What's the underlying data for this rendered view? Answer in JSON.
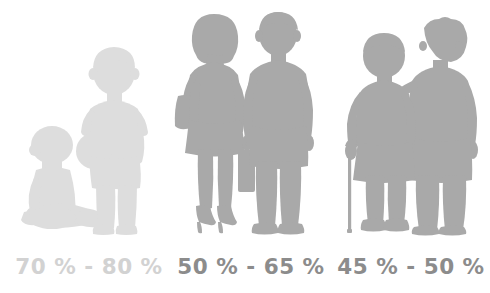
{
  "infographic": {
    "title": "Body water percentage by life stage",
    "background_color": "#ffffff",
    "groups": [
      {
        "id": "children",
        "name": "infants-and-children",
        "label": "70 % - 80 %",
        "range_low": 70,
        "range_high": 80,
        "unit": "%",
        "color": "#dddddd",
        "figures": [
          {
            "name": "sitting-baby",
            "pose": "seated profile facing right"
          },
          {
            "name": "standing-boy-with-ball",
            "pose": "standing, holding ball at left hip"
          }
        ],
        "props": [
          "ball"
        ]
      },
      {
        "id": "adults",
        "name": "adults",
        "label": "50 % - 65 %",
        "range_low": 50,
        "range_high": 65,
        "unit": "%",
        "color": "#a9a9a9",
        "figures": [
          {
            "name": "standing-woman-with-shoulder-bag",
            "pose": "standing in heels, shoulder bag on left arm"
          },
          {
            "name": "standing-man-with-briefcase",
            "pose": "standing, briefcase in right hand"
          }
        ],
        "props": [
          "shoulder-bag",
          "briefcase"
        ]
      },
      {
        "id": "seniors",
        "name": "elderly-couple",
        "label": "45 % - 50 %",
        "range_low": 45,
        "range_high": 50,
        "unit": "%",
        "color": "#a9a9a9",
        "figures": [
          {
            "name": "elderly-woman-with-cane",
            "pose": "standing, leaning on cane in right hand"
          },
          {
            "name": "elderly-man",
            "pose": "standing, arm around partner"
          }
        ],
        "props": [
          "walking-cane"
        ]
      }
    ]
  }
}
